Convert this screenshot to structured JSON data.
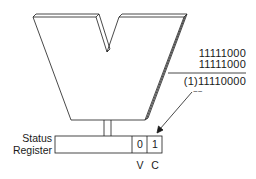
{
  "diagram": {
    "alu": {
      "shape": "V-shaped ALU block"
    },
    "addition": {
      "operand_1": "11111000",
      "operand_2": "11111000",
      "result": "(1)11110000",
      "carry_marker": "~~"
    },
    "status_register": {
      "label_line_1": "Status",
      "label_line_2": "Register",
      "cells": [
        {
          "flag": "V",
          "value": "0"
        },
        {
          "flag": "C",
          "value": "1"
        }
      ]
    },
    "colors": {
      "line": "#1a1a1a",
      "background": "#ffffff"
    }
  }
}
